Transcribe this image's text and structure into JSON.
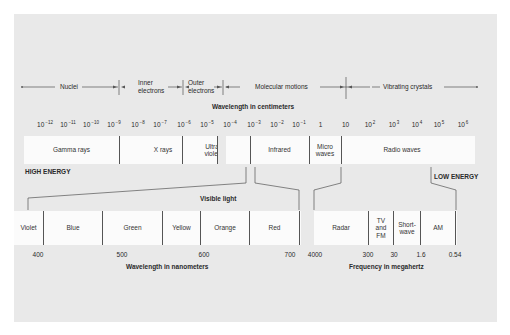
{
  "diagram": {
    "origins": [
      {
        "label": "Nuclei",
        "x_from": 22,
        "x_to": 118
      },
      {
        "label": "Inner electrons",
        "x_from": 120,
        "x_to": 182
      },
      {
        "label": "Outer electrons",
        "x_from": 184,
        "x_to": 222
      },
      {
        "label": "Molecular motions",
        "x_from": 224,
        "x_to": 344
      },
      {
        "label": "Vibrating crystals",
        "x_from": 346,
        "x_to": 478
      }
    ],
    "wavelength_axis": {
      "label": "Wavelength in centimeters",
      "ticks": [
        {
          "base": "10",
          "exp": "−12"
        },
        {
          "base": "10",
          "exp": "−11"
        },
        {
          "base": "10",
          "exp": "−10"
        },
        {
          "base": "10",
          "exp": "−9"
        },
        {
          "base": "10",
          "exp": "−8"
        },
        {
          "base": "10",
          "exp": "−7"
        },
        {
          "base": "10",
          "exp": "−6"
        },
        {
          "base": "10",
          "exp": "−5"
        },
        {
          "base": "10",
          "exp": "−4"
        },
        {
          "base": "10",
          "exp": "−3"
        },
        {
          "base": "10",
          "exp": "−2"
        },
        {
          "base": "10",
          "exp": "−1"
        },
        {
          "base": "1",
          "exp": ""
        },
        {
          "base": "10",
          "exp": ""
        },
        {
          "base": "10",
          "exp": "2"
        },
        {
          "base": "10",
          "exp": "3"
        },
        {
          "base": "10",
          "exp": "4"
        },
        {
          "base": "10",
          "exp": "5"
        },
        {
          "base": "10",
          "exp": "6"
        }
      ]
    },
    "spectrum_regions": [
      {
        "label": "Gamma rays"
      },
      {
        "label": "X rays"
      },
      {
        "label": "Ultra violet"
      },
      {
        "label": "Infrared"
      },
      {
        "label": "Micro waves"
      },
      {
        "label": "Radio waves"
      }
    ],
    "high_energy_label": "HIGH ENERGY",
    "low_energy_label": "LOW ENERGY",
    "visible_light_label": "Visible light",
    "visible_bands": [
      {
        "label": "Violet"
      },
      {
        "label": "Blue"
      },
      {
        "label": "Green"
      },
      {
        "label": "Yellow"
      },
      {
        "label": "Orange"
      },
      {
        "label": "Red"
      }
    ],
    "radio_bands": [
      {
        "label": "Radar"
      },
      {
        "label": "TV and FM"
      },
      {
        "label": "Short-wave"
      },
      {
        "label": "AM"
      }
    ],
    "nanometer_axis": {
      "label": "Wavelength in nanometers",
      "values": [
        "400",
        "500",
        "600",
        "700"
      ]
    },
    "frequency_axis": {
      "label": "Frequency in megahertz",
      "values": [
        "4000",
        "300",
        "30",
        "1.6",
        "0.54"
      ]
    }
  }
}
